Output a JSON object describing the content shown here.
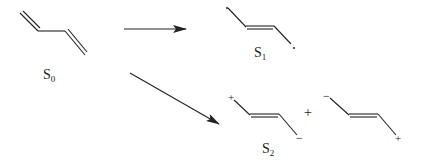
{
  "diagram": {
    "type": "reaction-scheme",
    "colors": {
      "stroke": "#222222",
      "background": "#ffffff"
    },
    "reactant": {
      "label_main": "S",
      "label_sub": "0",
      "structure": "butadiene (s-trans, two terminal double bonds)"
    },
    "products": [
      {
        "label_main": "S",
        "label_sub": "1",
        "structure": "diradical with central double bond",
        "terminal_marks": [
          "•",
          "•"
        ]
      },
      {
        "label_main": "S",
        "label_sub": "2",
        "structure": "zwitterionic resonance pair",
        "plus_between": "+",
        "forms": [
          {
            "left_charge": "+",
            "right_charge": "−"
          },
          {
            "left_charge": "−",
            "right_charge": "+"
          }
        ]
      }
    ],
    "arrows": [
      {
        "from": "S0",
        "to": "S1"
      },
      {
        "from": "S0",
        "to": "S2"
      }
    ]
  }
}
